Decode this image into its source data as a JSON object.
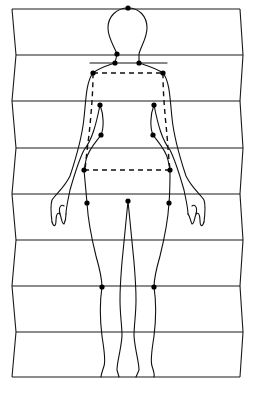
{
  "diagram": {
    "title": "",
    "colors": {
      "line": "#111111",
      "background": "#ffffff"
    },
    "grid": {
      "horizontal_lines_y": [
        9,
        55,
        101,
        148,
        194,
        240,
        286,
        332,
        377
      ],
      "left_edge_x": [
        12,
        16,
        12,
        16,
        12,
        16,
        12,
        16,
        12
      ],
      "right_edge_x": [
        240,
        243,
        240,
        243,
        240,
        243,
        240,
        243,
        240
      ],
      "zigzag_edges": true
    },
    "landmarks": [
      {
        "name": "head-top",
        "x": 128,
        "y": 8
      },
      {
        "name": "neck-left",
        "x": 117,
        "y": 54
      },
      {
        "name": "neck-base-left",
        "x": 115,
        "y": 63
      },
      {
        "name": "neck-base-right",
        "x": 139,
        "y": 63
      },
      {
        "name": "shoulder-left",
        "x": 93,
        "y": 73
      },
      {
        "name": "shoulder-right",
        "x": 163,
        "y": 73
      },
      {
        "name": "armpit-left",
        "x": 100,
        "y": 105
      },
      {
        "name": "armpit-right",
        "x": 154,
        "y": 105
      },
      {
        "name": "bust-left",
        "x": 101,
        "y": 135
      },
      {
        "name": "bust-right",
        "x": 153,
        "y": 135
      },
      {
        "name": "hip-left",
        "x": 84,
        "y": 170
      },
      {
        "name": "hip-right",
        "x": 170,
        "y": 170
      },
      {
        "name": "thigh-left",
        "x": 87,
        "y": 203
      },
      {
        "name": "thigh-right",
        "x": 169,
        "y": 203
      },
      {
        "name": "crotch",
        "x": 128,
        "y": 201
      },
      {
        "name": "knee-left",
        "x": 102,
        "y": 287
      },
      {
        "name": "knee-right",
        "x": 154,
        "y": 287
      }
    ],
    "reference_lines": [
      {
        "name": "neck-base-line",
        "type": "solid",
        "x1": 90,
        "y1": 63,
        "x2": 167,
        "y2": 63
      },
      {
        "name": "shoulder-width-line",
        "type": "dashed",
        "x1": 93,
        "y1": 73,
        "x2": 163,
        "y2": 73
      },
      {
        "name": "hip-width-line",
        "type": "dashed",
        "x1": 84,
        "y1": 170,
        "x2": 170,
        "y2": 170
      },
      {
        "name": "side-seam-left",
        "type": "dashed"
      },
      {
        "name": "side-seam-right",
        "type": "dashed"
      }
    ]
  }
}
